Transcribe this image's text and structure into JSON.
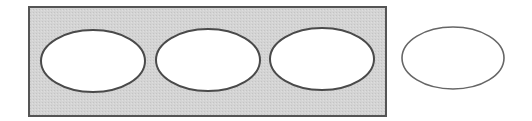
{
  "diagram": {
    "colors": {
      "background": "#ffffff",
      "container_fill": "#d3d3d3",
      "container_stroke": "#555555",
      "ellipse_fill": "#ffffff",
      "ellipse_stroke": "#4a4a4a",
      "outside_ellipse_stroke": "#666666"
    },
    "container": {
      "x": 29,
      "y": 7,
      "width": 357,
      "height": 109
    },
    "ellipses_inside": [
      {
        "cx": 93,
        "cy": 61,
        "rx": 52,
        "ry": 31
      },
      {
        "cx": 208,
        "cy": 60,
        "rx": 52,
        "ry": 31
      },
      {
        "cx": 322,
        "cy": 59,
        "rx": 52,
        "ry": 31
      }
    ],
    "ellipse_outside": {
      "cx": 453,
      "cy": 58,
      "rx": 51,
      "ry": 31
    }
  }
}
